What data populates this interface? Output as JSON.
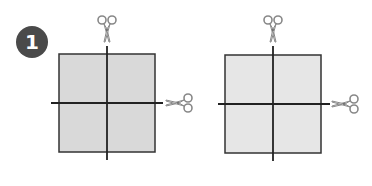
{
  "step": {
    "number": "1",
    "badge_color": "#4a4a4a",
    "text_color": "#ffffff"
  },
  "panels": [
    {
      "name": "left",
      "square": {
        "x": 59,
        "y": 54,
        "size": 96,
        "fill": "#d9d9d9",
        "stroke": "#333333"
      },
      "cut_lines": {
        "vertical": {
          "x": 107,
          "y1": 46,
          "y2": 160
        },
        "horizontal": {
          "y": 103,
          "x1": 51,
          "x2": 163
        }
      },
      "scissors": [
        {
          "icon": "scissors-icon",
          "orientation": "down",
          "x": 107,
          "y": 30
        },
        {
          "icon": "scissors-icon",
          "orientation": "left",
          "x": 178,
          "y": 103
        }
      ]
    },
    {
      "name": "right",
      "square": {
        "x": 225,
        "y": 55,
        "size": 96,
        "fill": "#e6e6e6",
        "stroke": "#333333"
      },
      "cut_lines": {
        "vertical": {
          "x": 273,
          "y1": 46,
          "y2": 161
        },
        "horizontal": {
          "y": 104,
          "x1": 218,
          "x2": 330
        }
      },
      "scissors": [
        {
          "icon": "scissors-icon",
          "orientation": "down",
          "x": 273,
          "y": 30
        },
        {
          "icon": "scissors-icon",
          "orientation": "left",
          "x": 344,
          "y": 104
        }
      ]
    }
  ]
}
